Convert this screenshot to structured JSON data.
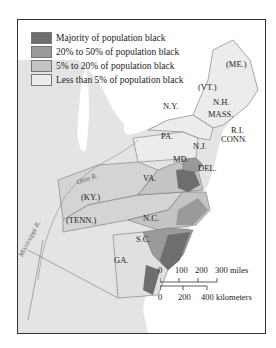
{
  "map": {
    "legend": [
      {
        "label": "Majority of population black",
        "color": "#6e6e6e"
      },
      {
        "label": "20% to 50% of population black",
        "color": "#9a9a9a"
      },
      {
        "label": "5% to 20% of population black",
        "color": "#c4c4c4"
      },
      {
        "label": "Less than 5% of population black",
        "color": "#ececec"
      }
    ],
    "state_labels": {
      "me": "(ME.)",
      "vt": "(VT.)",
      "nh": "N.H.",
      "ny": "N.Y.",
      "mass": "MASS.",
      "ri": "R.I.",
      "conn": "CONN.",
      "pa": "PA.",
      "nj": "N.J.",
      "md": "MD.",
      "del": "DEL.",
      "va": "VA.",
      "ky": "(KY.)",
      "tenn": "(TENN.)",
      "nc": "N.C.",
      "sc": "S.C.",
      "ga": "GA."
    },
    "rivers": {
      "ohio": "Ohio R.",
      "mississippi": "Mississippi R."
    },
    "scale": {
      "miles_ticks": [
        "0",
        "100",
        "200",
        "300 miles"
      ],
      "km_ticks": [
        "0",
        "200",
        "400 kilometers"
      ]
    },
    "colors": {
      "water": "#ffffff",
      "land_outside": "#e4e4e4",
      "majority": "#6e6e6e",
      "twenty_fifty": "#9a9a9a",
      "five_twenty": "#c4c4c4",
      "less_five": "#ececec"
    }
  }
}
